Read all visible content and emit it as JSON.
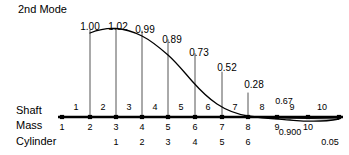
{
  "figure": {
    "title": "2nd Mode",
    "row_labels": {
      "shaft": "Shaft",
      "mass": "Mass",
      "cylinder": "Cylinder"
    }
  },
  "chart_data": {
    "type": "line",
    "title": "2nd Mode",
    "xlabel": "",
    "ylabel": "",
    "grid": false,
    "legend": null,
    "categories": [
      "1",
      "2",
      "3",
      "4",
      "5",
      "6",
      "7",
      "8",
      "9",
      "10"
    ],
    "x": [
      1,
      2,
      3,
      4,
      5,
      6,
      7,
      8,
      9,
      10
    ],
    "values": [
      1.0,
      1.02,
      0.99,
      0.89,
      0.73,
      0.52,
      0.28,
      0.67,
      0.9,
      0.05
    ],
    "point_labels": [
      "1.00",
      "1.02",
      "0.99",
      "0.89",
      "0.73",
      "0.52",
      "0.28",
      "0.67",
      "0.900",
      "0.05"
    ],
    "ylim": [
      -0.1,
      1.1
    ],
    "xlim": [
      0.5,
      10.5
    ]
  },
  "masses": [
    {
      "label": "1",
      "x": 62,
      "amplitude": null,
      "amp_label": null,
      "has_ordinate": false
    },
    {
      "label": "2",
      "x": 90,
      "amplitude": 1.0,
      "amp_label": "1.00",
      "has_ordinate": true
    },
    {
      "label": "3",
      "x": 116,
      "amplitude": 1.02,
      "amp_label": "1.02",
      "has_ordinate": true
    },
    {
      "label": "4",
      "x": 142,
      "amplitude": 0.99,
      "amp_label": "0.99",
      "has_ordinate": true
    },
    {
      "label": "5",
      "x": 168,
      "amplitude": 0.89,
      "amp_label": "0.89",
      "has_ordinate": true
    },
    {
      "label": "6",
      "x": 195,
      "amplitude": 0.73,
      "amp_label": "0.73",
      "has_ordinate": true
    },
    {
      "label": "7",
      "x": 222,
      "amplitude": 0.52,
      "amp_label": "0.52",
      "has_ordinate": true
    },
    {
      "label": "8",
      "x": 248,
      "amplitude": 0.28,
      "amp_label": "0.28",
      "has_ordinate": true
    },
    {
      "label": "9",
      "x": 277,
      "amplitude": null,
      "amp_label": "0.900",
      "has_ordinate": false
    },
    {
      "label": "10",
      "x": 308,
      "amplitude": null,
      "amp_label": null,
      "has_ordinate": false
    },
    {
      "label": "",
      "x": 339,
      "amplitude": null,
      "amp_label": "0.05",
      "has_ordinate": false
    }
  ],
  "shaft_numbers": [
    {
      "label": "1",
      "x": 76
    },
    {
      "label": "2",
      "x": 103
    },
    {
      "label": "3",
      "x": 129
    },
    {
      "label": "4",
      "x": 155
    },
    {
      "label": "5",
      "x": 181
    },
    {
      "label": "6",
      "x": 208
    },
    {
      "label": "7",
      "x": 235
    },
    {
      "label": "8",
      "x": 262
    },
    {
      "label": "9",
      "x": 292
    },
    {
      "label": "10",
      "x": 322
    }
  ],
  "cylinder_numbers": [
    {
      "label": "1",
      "x": 116
    },
    {
      "label": "2",
      "x": 142
    },
    {
      "label": "3",
      "x": 168
    },
    {
      "label": "4",
      "x": 195
    },
    {
      "label": "5",
      "x": 222
    },
    {
      "label": "6",
      "x": 248
    }
  ],
  "ordinate_labels": [
    {
      "text": "1.00",
      "x": 90,
      "y": 22,
      "anchor": "middle",
      "small": false
    },
    {
      "text": "1.02",
      "x": 118,
      "y": 22,
      "anchor": "middle",
      "small": false
    },
    {
      "text": "0.99",
      "x": 145,
      "y": 25,
      "anchor": "middle",
      "small": false
    },
    {
      "text": "0.89",
      "x": 172,
      "y": 35,
      "anchor": "middle",
      "small": false
    },
    {
      "text": "0.73",
      "x": 199,
      "y": 48,
      "anchor": "middle",
      "small": false
    },
    {
      "text": "0.52",
      "x": 227,
      "y": 63,
      "anchor": "middle",
      "small": false
    },
    {
      "text": "0.28",
      "x": 254,
      "y": 80,
      "anchor": "middle",
      "small": false
    },
    {
      "text": "0.67",
      "x": 284,
      "y": 97,
      "anchor": "middle",
      "small": true
    },
    {
      "text": "0.900",
      "x": 290,
      "y": 128,
      "anchor": "middle",
      "small": true
    },
    {
      "text": "0.05",
      "x": 330,
      "y": 138,
      "anchor": "middle",
      "small": true
    }
  ],
  "colors": {
    "ink": "#000000",
    "background": "#ffffff",
    "ordinate_line": "#555555"
  },
  "geometry": {
    "baseline_y": 117,
    "baseline_x_start": 58,
    "baseline_x_end": 343,
    "curve_path": "M 90 33 C 100 29, 108 28, 116 28.5 C 126 29, 134 32, 142 36 C 152 41, 160 48, 168 55 C 177 63, 184 72, 192 81 C 200 90, 208 98, 217 104 C 226 110, 236 114, 248 116 C 262 118, 278 119, 290 120 C 302 121, 318 123, 339 119",
    "tail_path": "M 277 118 L 339 119"
  }
}
